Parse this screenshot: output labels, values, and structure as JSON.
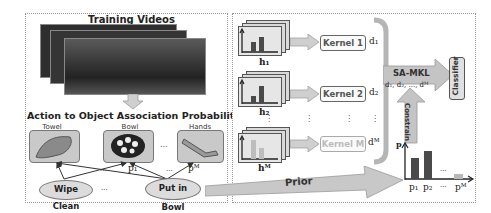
{
  "left_panel": {
    "title": "Training Videos",
    "assoc_title": "Action to Object Association Probability p",
    "objects": [
      {
        "label": "Towel"
      },
      {
        "label": "Bowl"
      },
      {
        "label": "Hands"
      }
    ],
    "object_ellipsis": "...",
    "actions": [
      {
        "label": "Wipe Clean"
      },
      {
        "label": "Put in Bowl"
      }
    ],
    "action_ellipsis": "...",
    "edge_labels": {
      "p1": "p₁",
      "pM": "pᴹ",
      "dots1": "...",
      "dots2": "..."
    }
  },
  "right_panel": {
    "features": [
      {
        "label": "h₁",
        "kernel": "Kernel 1",
        "weight": "d₁"
      },
      {
        "label": "h₂",
        "kernel": "Kernel 2",
        "weight": "d₂"
      },
      {
        "label": "hᴹ",
        "kernel": "Kernel M",
        "weight": "dᴹ"
      }
    ],
    "vdots": "⋮",
    "sa_mkl": {
      "label": "SA-MKL",
      "weights": "d₁, d₂, ..., dᴹ"
    },
    "classifier": "Classifier",
    "constrain": "Constrain",
    "prior_chart": {
      "y_label": "p",
      "x_labels": [
        "p₁",
        "p₂",
        "...",
        "pᴹ"
      ],
      "dots": "..."
    }
  },
  "prior_arrow": {
    "label": "Prior"
  },
  "colors": {
    "bar_dark": "#4a4a4a",
    "bar_light": "#b8b8b8",
    "arrow_fill": "#cfcfcf",
    "frame_border": "#555555"
  }
}
